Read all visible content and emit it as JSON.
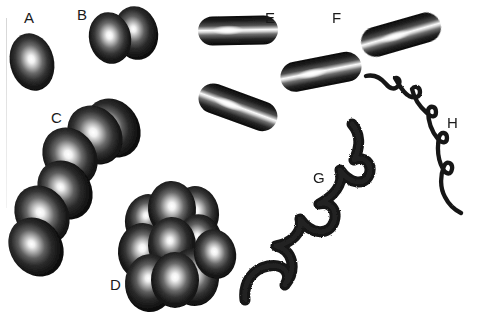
{
  "figure": {
    "background_color": "#ffffff",
    "ink_color": "#111111",
    "label_color": "#1a1a1a",
    "width": 477,
    "height": 314,
    "labels": [
      {
        "id": "A",
        "text": "A",
        "x": 24,
        "y": 10,
        "describes": "single-coccus"
      },
      {
        "id": "B",
        "text": "B",
        "x": 77,
        "y": 7,
        "describes": "diplococci"
      },
      {
        "id": "C",
        "text": "C",
        "x": 51,
        "y": 110,
        "describes": "streptococci-chain"
      },
      {
        "id": "D",
        "text": "D",
        "x": 110,
        "y": 277,
        "describes": "staphylococci-cluster"
      },
      {
        "id": "E",
        "text": "E",
        "x": 265,
        "y": 10,
        "describes": "single-bacillus"
      },
      {
        "id": "F",
        "text": "F",
        "x": 332,
        "y": 10,
        "describes": "streptobacilli-chain"
      },
      {
        "id": "G",
        "text": "G",
        "x": 313,
        "y": 170,
        "describes": "spirillum-thick-helix"
      },
      {
        "id": "H",
        "text": "H",
        "x": 447,
        "y": 115,
        "describes": "spirochete-thin-helix"
      }
    ],
    "organisms": [
      {
        "id": "A",
        "shape": "coccus",
        "arrangement": "single",
        "count": 1
      },
      {
        "id": "B",
        "shape": "coccus",
        "arrangement": "diplococci",
        "count": 2
      },
      {
        "id": "C",
        "shape": "coccus",
        "arrangement": "streptococci",
        "count": 6
      },
      {
        "id": "D",
        "shape": "coccus",
        "arrangement": "staphylococci",
        "count": 10
      },
      {
        "id": "E",
        "shape": "bacillus",
        "arrangement": "single",
        "count": 1
      },
      {
        "id": "F",
        "shape": "bacillus",
        "arrangement": "streptobacilli",
        "count": 3
      },
      {
        "id": "G",
        "shape": "spirillum",
        "arrangement": "helix",
        "turns": 4
      },
      {
        "id": "H",
        "shape": "spirochete",
        "arrangement": "helix",
        "turns": 7
      }
    ]
  }
}
